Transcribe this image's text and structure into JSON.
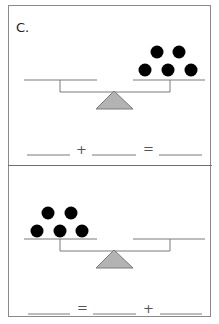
{
  "worksheet": {
    "problem_label": "C.",
    "colors": {
      "border": "#8a8a8a",
      "line": "#7a7a7a",
      "fulcrum_fill": "#b3b3b3",
      "dot": "#000000"
    },
    "panels": [
      {
        "id": "top",
        "scale": {
          "left_pan_count": 0,
          "right_pan_count": 5
        },
        "equation": {
          "op1": "+",
          "op2": "=",
          "blanks": [
            "",
            "",
            ""
          ]
        }
      },
      {
        "id": "bottom",
        "scale": {
          "left_pan_count": 5,
          "right_pan_count": 0
        },
        "equation": {
          "op1": "=",
          "op2": "+",
          "blanks": [
            "",
            "",
            ""
          ]
        }
      }
    ]
  }
}
